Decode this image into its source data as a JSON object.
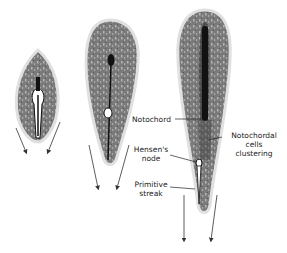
{
  "diagram": {
    "stages": [
      {
        "id": "early",
        "description": "Early embryo with short primitive streak"
      },
      {
        "id": "mid",
        "description": "Elongating embryo with node and streak"
      },
      {
        "id": "late",
        "description": "Elongated embryo with notochord"
      }
    ],
    "labels": {
      "notochord": "Notochord",
      "notochordal_cells": [
        "Notochordal",
        "cells",
        "clustering"
      ],
      "hensens_node": [
        "Hensen's",
        "node"
      ],
      "primitive_streak": [
        "Primitive",
        "streak"
      ]
    },
    "colors": {
      "body_fill": "#7a7a7a",
      "body_outline": "#d9d9d9",
      "notochord": "#111111",
      "arrow": "#333333",
      "text": "#222222"
    }
  }
}
